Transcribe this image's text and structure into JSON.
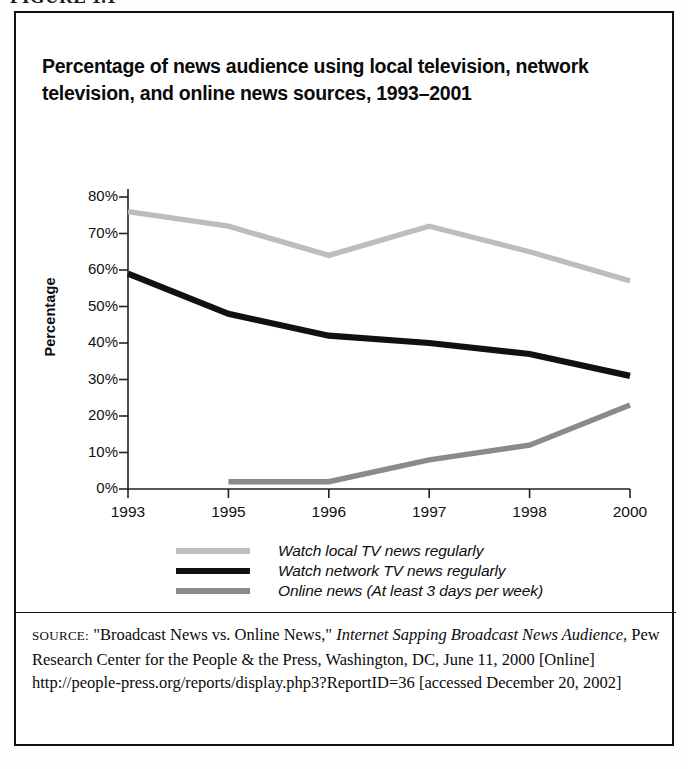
{
  "figure": {
    "label": "FIGURE 1.1",
    "title": "Percentage of news audience using local television, network television, and online news sources, 1993–2001"
  },
  "source": {
    "prefix": "SOURCE:",
    "part1": " \"Broadcast News vs. Online News,\" ",
    "italic1": "Internet Sapping Broadcast News Audience,",
    "part2": " Pew Research Center for the People & the Press, Washington, DC, June 11, 2000 [Online] http://people-press.org/reports/display.php3?ReportID=36 [accessed December 20, 2002]"
  },
  "legend": {
    "items": [
      {
        "label": "Watch local TV news regularly",
        "color": "#bdbdbd",
        "thickness": 6
      },
      {
        "label": "Watch network TV news regularly",
        "color": "#111111",
        "thickness": 6
      },
      {
        "label": "Online news (At least 3 days per week)",
        "color": "#8a8a8a",
        "thickness": 6
      }
    ]
  },
  "chart_data": {
    "type": "line",
    "title": "Percentage of news audience using local television, network television, and online news sources, 1993–2001",
    "xlabel": "",
    "ylabel": "Percentage",
    "x": [
      1993,
      1995,
      1996,
      1997,
      1998,
      2000
    ],
    "xtick_labels": [
      "1993",
      "1995",
      "1996",
      "1997",
      "1998",
      "2000"
    ],
    "ytick_labels": [
      "0%",
      "10%",
      "20%",
      "30%",
      "40%",
      "50%",
      "60%",
      "70%",
      "80%"
    ],
    "yticks": [
      0,
      10,
      20,
      30,
      40,
      50,
      60,
      70,
      80
    ],
    "ylim": [
      0,
      80
    ],
    "grid": false,
    "legend_position": "below-axes",
    "series": [
      {
        "name": "Watch local TV news regularly",
        "color": "#bdbdbd",
        "values": [
          76,
          72,
          64,
          72,
          65,
          57
        ]
      },
      {
        "name": "Watch network TV news regularly",
        "color": "#111111",
        "values": [
          59,
          48,
          42,
          40,
          37,
          31
        ]
      },
      {
        "name": "Online news (At least 3 days per week)",
        "color": "#8a8a8a",
        "values": [
          null,
          2,
          2,
          8,
          12,
          23
        ]
      }
    ]
  }
}
